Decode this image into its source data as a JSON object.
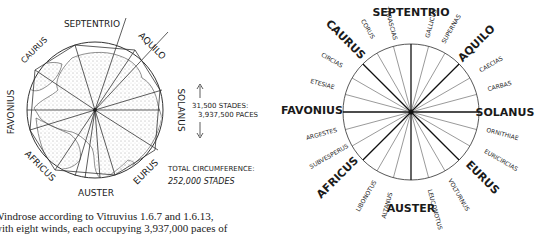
{
  "left_diagram": {
    "title": "Windrose over world map",
    "winds": [
      {
        "name": "SEPTENTRIO",
        "x": 92,
        "y": 27,
        "rot": 0,
        "size": 9
      },
      {
        "name": "AQUILO",
        "x": 150,
        "y": 48,
        "rot": 45,
        "size": 9
      },
      {
        "name": "SOLANUS",
        "x": 178,
        "y": 110,
        "rot": 90,
        "size": 9
      },
      {
        "name": "EURUS",
        "x": 148,
        "y": 172,
        "rot": -45,
        "size": 9
      },
      {
        "name": "AUSTER",
        "x": 96,
        "y": 196,
        "rot": 0,
        "size": 9
      },
      {
        "name": "AFRICUS",
        "x": 38,
        "y": 170,
        "rot": 45,
        "size": 9
      },
      {
        "name": "FAVONIUS",
        "x": 14,
        "y": 112,
        "rot": -90,
        "size": 9
      },
      {
        "name": "CAURUS",
        "x": 36,
        "y": 52,
        "rot": -45,
        "size": 8
      }
    ],
    "distance_label": {
      "line1": "31,500 STADES:",
      "line2": "3,937,500 PACES"
    },
    "circumference_label": {
      "line1": "TOTAL CIRCUMFERENCE:",
      "line2": "252,000 STADES"
    }
  },
  "right_diagram": {
    "title": "24-wind rose",
    "major_winds": [
      {
        "name": "SEPTENTRIO",
        "x": 411,
        "y": 16,
        "rot": 0
      },
      {
        "name": "AQUILO",
        "x": 479,
        "y": 44,
        "rot": -45
      },
      {
        "name": "SOLANUS",
        "x": 505,
        "y": 116,
        "rot": 0
      },
      {
        "name": "EURUS",
        "x": 480,
        "y": 182,
        "rot": 45
      },
      {
        "name": "AUSTER",
        "x": 411,
        "y": 212,
        "rot": 0
      },
      {
        "name": "AFRICUS",
        "x": 338,
        "y": 180,
        "rot": -45
      },
      {
        "name": "FAVONIUS",
        "x": 315,
        "y": 113,
        "rot": 0
      },
      {
        "name": "CAURUS",
        "x": 343,
        "y": 42,
        "rot": 45
      }
    ],
    "minor_winds": [
      {
        "name": "GALLICUS",
        "x": 432,
        "y": 26,
        "rot": -75
      },
      {
        "name": "SUPERNAS",
        "x": 454,
        "y": 30,
        "rot": -60
      },
      {
        "name": "CAECIAS",
        "x": 492,
        "y": 66,
        "rot": -30
      },
      {
        "name": "CARBAS",
        "x": 500,
        "y": 86,
        "rot": -15
      },
      {
        "name": "ORNITHIAE",
        "x": 502,
        "y": 138,
        "rot": 15
      },
      {
        "name": "EURICIRCIAS",
        "x": 500,
        "y": 163,
        "rot": 30
      },
      {
        "name": "VOLTURNUS",
        "x": 457,
        "y": 196,
        "rot": 60
      },
      {
        "name": "LEUCONOTUS",
        "x": 432,
        "y": 208,
        "rot": 75
      },
      {
        "name": "ALTANUS",
        "x": 389,
        "y": 206,
        "rot": -75
      },
      {
        "name": "LIBONOTUS",
        "x": 368,
        "y": 197,
        "rot": -60
      },
      {
        "name": "SUBVESPERUS",
        "x": 331,
        "y": 158,
        "rot": -30
      },
      {
        "name": "ARGESTES",
        "x": 322,
        "y": 136,
        "rot": -15
      },
      {
        "name": "ETESIAE",
        "x": 322,
        "y": 86,
        "rot": 15
      },
      {
        "name": "CIRCIAS",
        "x": 331,
        "y": 62,
        "rot": 30
      },
      {
        "name": "CORUS",
        "x": 365,
        "y": 30,
        "rot": 60
      },
      {
        "name": "THRASCIAS",
        "x": 389,
        "y": 26,
        "rot": 75
      }
    ]
  },
  "caption": {
    "line1": "Windrose according to Vitruvius 1.6.7 and 1.6.13,",
    "line2": "with eight winds, each occupying 3,937,000 paces of"
  }
}
